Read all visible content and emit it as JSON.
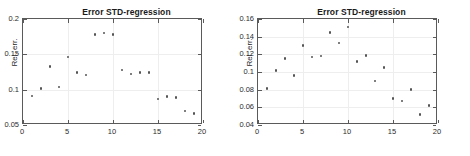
{
  "figure": {
    "background_color": "#ffffff",
    "marker_color": "#545454",
    "axis_color": "#5a5a5a",
    "grid_color": "#eeeeee"
  },
  "chart_data": [
    {
      "type": "scatter",
      "panel": "left",
      "title": "Error STD-regression",
      "xlabel": "",
      "ylabel": "Rel. err.",
      "xlim": [
        0,
        20
      ],
      "ylim": [
        0.05,
        0.2
      ],
      "xticks": [
        0,
        5,
        10,
        15,
        20
      ],
      "xticklabels": [
        "0",
        "5",
        "10",
        "15",
        "20"
      ],
      "yticks": [
        0.05,
        0.1,
        0.15,
        0.2
      ],
      "yticklabels": [
        "0.05",
        "0.1",
        "0.15",
        "0.2"
      ],
      "grid": true,
      "legend": null,
      "marker": "asterisk",
      "x": [
        1,
        2,
        3,
        4,
        5,
        6,
        7,
        8,
        9,
        10,
        11,
        12,
        13,
        14,
        15,
        16,
        17,
        18,
        19
      ],
      "y": [
        0.091,
        0.102,
        0.133,
        0.104,
        0.146,
        0.124,
        0.121,
        0.178,
        0.18,
        0.178,
        0.128,
        0.122,
        0.124,
        0.124,
        0.087,
        0.09,
        0.089,
        0.07,
        0.066
      ]
    },
    {
      "type": "scatter",
      "panel": "right",
      "title": "Error STD-regression",
      "xlabel": "",
      "ylabel": "Rel. err.",
      "xlim": [
        0,
        20
      ],
      "ylim": [
        0.04,
        0.16
      ],
      "xticks": [
        0,
        5,
        10,
        15,
        20
      ],
      "xticklabels": [
        "0",
        "5",
        "10",
        "15",
        "20"
      ],
      "yticks": [
        0.04,
        0.06,
        0.08,
        0.1,
        0.12,
        0.14,
        0.16
      ],
      "yticklabels": [
        "0.04",
        "0.06",
        "0.08",
        "0.1",
        "0.12",
        "0.14",
        "0.16"
      ],
      "grid": true,
      "legend": null,
      "marker": "asterisk",
      "x": [
        1,
        2,
        3,
        4,
        5,
        6,
        7,
        8,
        9,
        10,
        11,
        12,
        13,
        14,
        15,
        16,
        17,
        18,
        19
      ],
      "y": [
        0.081,
        0.102,
        0.115,
        0.096,
        0.13,
        0.117,
        0.118,
        0.145,
        0.133,
        0.151,
        0.112,
        0.119,
        0.09,
        0.105,
        0.07,
        0.067,
        0.08,
        0.052,
        0.062
      ]
    }
  ]
}
